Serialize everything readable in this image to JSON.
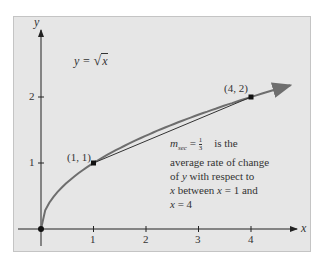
{
  "chart_data": {
    "type": "line",
    "title": "",
    "xlabel": "x",
    "ylabel": "y",
    "xlim": [
      -0.5,
      4.9
    ],
    "ylim": [
      -0.4,
      2.9
    ],
    "x_ticks": [
      "1",
      "2",
      "3",
      "4"
    ],
    "y_ticks": [
      "1",
      "2"
    ],
    "grid": false,
    "series": [
      {
        "name": "y = √x",
        "function": "sqrt(x)",
        "x": [
          0,
          0.25,
          0.5,
          1,
          1.5,
          2,
          2.5,
          3,
          3.5,
          4,
          4.6
        ],
        "values": [
          0,
          0.5,
          0.707,
          1,
          1.225,
          1.414,
          1.581,
          1.732,
          1.871,
          2,
          2.145
        ],
        "color": "#6e6e6e"
      },
      {
        "name": "secant line",
        "x": [
          1,
          4
        ],
        "values": [
          1,
          2
        ],
        "color": "#333333"
      }
    ],
    "points": [
      {
        "x": 0,
        "y": 0,
        "label": ""
      },
      {
        "x": 1,
        "y": 1,
        "label": "(1, 1)"
      },
      {
        "x": 4,
        "y": 2,
        "label": "(4, 2)"
      }
    ],
    "annotations": [
      {
        "text": "y = √x"
      },
      {
        "text": "m_sec = 1/3 is the average rate of change of y with respect to x between x = 1 and x = 4"
      }
    ]
  },
  "labels": {
    "x_axis": "x",
    "y_axis": "y",
    "equation_lhs": "y = ",
    "equation_rad": "x",
    "tick_x1": "1",
    "tick_x2": "2",
    "tick_x3": "3",
    "tick_x4": "4",
    "tick_y1": "1",
    "tick_y2": "2",
    "point_1_1": "(1, 1)",
    "point_4_2": "(4, 2)",
    "msec_m": "m",
    "msec_sub": "sec",
    "msec_eq": " = ",
    "msec_num": "1",
    "msec_den": "3",
    "msec_rest": "is the",
    "anno_line2": "average rate of change",
    "anno_line3_a": "of ",
    "anno_line3_y": "y",
    "anno_line3_b": " with respect to",
    "anno_line4_x": "x",
    "anno_line4_b": " between ",
    "anno_line4_x2": "x",
    "anno_line4_c": " = 1 and",
    "anno_line5_x": "x",
    "anno_line5_b": " = 4"
  },
  "colors": {
    "panel": "#e6e6e6",
    "curve": "#6e6e6e",
    "axis": "#222222"
  }
}
